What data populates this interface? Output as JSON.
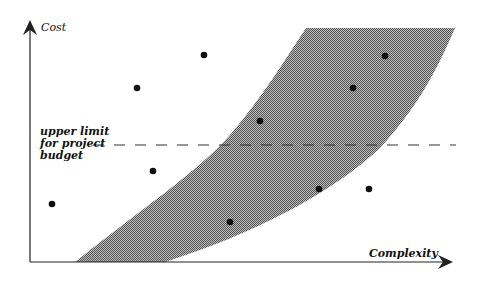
{
  "diagram": {
    "title": "",
    "y_axis_label": "Cost",
    "x_axis_label": "Complexity",
    "budget_label": {
      "line1": "upper limit",
      "line2": "for project",
      "line3": "budget"
    },
    "colors": {
      "axis": "#222222",
      "band": "#8c8c8c",
      "points": "#111111",
      "dashed_line": "#333333"
    },
    "band": {
      "description": "shaded region of feasible cost vs complexity",
      "upper_left_curve": [
        [
          75,
          262
        ],
        [
          120,
          225
        ],
        [
          160,
          195
        ],
        [
          190,
          172
        ],
        [
          210,
          158
        ],
        [
          230,
          135
        ],
        [
          250,
          110
        ],
        [
          270,
          85
        ],
        [
          290,
          55
        ],
        [
          306,
          28
        ]
      ],
      "lower_right_curve": [
        [
          455,
          28
        ],
        [
          440,
          60
        ],
        [
          420,
          100
        ],
        [
          400,
          128
        ],
        [
          380,
          148
        ],
        [
          350,
          177
        ],
        [
          300,
          208
        ],
        [
          230,
          240
        ],
        [
          165,
          262
        ]
      ]
    },
    "budget_line_y": 145,
    "points": [
      {
        "x": 52,
        "y": 204
      },
      {
        "x": 137,
        "y": 88
      },
      {
        "x": 153,
        "y": 171
      },
      {
        "x": 204,
        "y": 55
      },
      {
        "x": 230,
        "y": 222
      },
      {
        "x": 260,
        "y": 121
      },
      {
        "x": 319,
        "y": 189
      },
      {
        "x": 353,
        "y": 88
      },
      {
        "x": 369,
        "y": 189
      },
      {
        "x": 385,
        "y": 56
      }
    ]
  }
}
